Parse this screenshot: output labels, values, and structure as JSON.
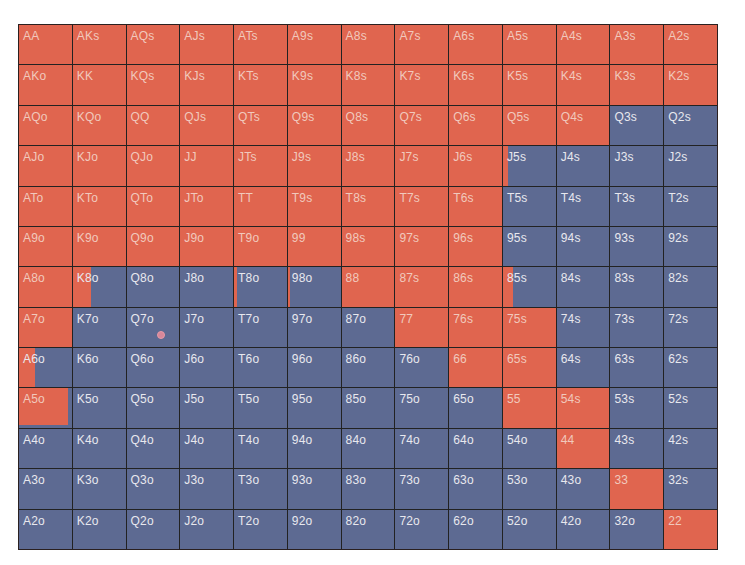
{
  "colors": {
    "raise": "#e0654f",
    "fold": "#5d6a92",
    "grid_line": "#222222",
    "label_on_red": "#f1c9bd",
    "label_on_blue": "#e8e8ee"
  },
  "chart_data": {
    "type": "heatmap",
    "title": "",
    "ranks": [
      "A",
      "K",
      "Q",
      "J",
      "T",
      "9",
      "8",
      "7",
      "6",
      "5",
      "4",
      "3",
      "2"
    ],
    "legend": [
      {
        "name": "raise",
        "color": "#e0654f"
      },
      {
        "name": "fold",
        "color": "#5d6a92"
      }
    ],
    "rows": [
      {
        "hands": [
          "AA",
          "AKs",
          "AQs",
          "AJs",
          "ATs",
          "A9s",
          "A8s",
          "A7s",
          "A6s",
          "A5s",
          "A4s",
          "A3s",
          "A2s"
        ],
        "raise": [
          1,
          1,
          1,
          1,
          1,
          1,
          1,
          1,
          1,
          1,
          1,
          1,
          1
        ]
      },
      {
        "hands": [
          "AKo",
          "KK",
          "KQs",
          "KJs",
          "KTs",
          "K9s",
          "K8s",
          "K7s",
          "K6s",
          "K5s",
          "K4s",
          "K3s",
          "K2s"
        ],
        "raise": [
          1,
          1,
          1,
          1,
          1,
          1,
          1,
          1,
          1,
          1,
          1,
          1,
          1
        ]
      },
      {
        "hands": [
          "AQo",
          "KQo",
          "QQ",
          "QJs",
          "QTs",
          "Q9s",
          "Q8s",
          "Q7s",
          "Q6s",
          "Q5s",
          "Q4s",
          "Q3s",
          "Q2s"
        ],
        "raise": [
          1,
          1,
          1,
          1,
          1,
          1,
          1,
          1,
          1,
          1,
          1,
          0,
          0
        ]
      },
      {
        "hands": [
          "AJo",
          "KJo",
          "QJo",
          "JJ",
          "JTs",
          "J9s",
          "J8s",
          "J7s",
          "J6s",
          "J5s",
          "J4s",
          "J3s",
          "J2s"
        ],
        "raise": [
          1,
          1,
          1,
          1,
          1,
          1,
          1,
          1,
          1,
          0.1,
          0,
          0,
          0
        ]
      },
      {
        "hands": [
          "ATo",
          "KTo",
          "QTo",
          "JTo",
          "TT",
          "T9s",
          "T8s",
          "T7s",
          "T6s",
          "T5s",
          "T4s",
          "T3s",
          "T2s"
        ],
        "raise": [
          1,
          1,
          1,
          1,
          1,
          1,
          1,
          1,
          1,
          0,
          0,
          0,
          0
        ]
      },
      {
        "hands": [
          "A9o",
          "K9o",
          "Q9o",
          "J9o",
          "T9o",
          "99",
          "98s",
          "97s",
          "96s",
          "95s",
          "94s",
          "93s",
          "92s"
        ],
        "raise": [
          1,
          1,
          1,
          1,
          1,
          1,
          1,
          1,
          1,
          0,
          0,
          0,
          0
        ]
      },
      {
        "hands": [
          "A8o",
          "K8o",
          "Q8o",
          "J8o",
          "T8o",
          "98o",
          "88",
          "87s",
          "86s",
          "85s",
          "84s",
          "83s",
          "82s"
        ],
        "raise": [
          1,
          0.35,
          0,
          0,
          0.05,
          0.05,
          1,
          1,
          1,
          0.2,
          0,
          0,
          0
        ]
      },
      {
        "hands": [
          "A7o",
          "K7o",
          "Q7o",
          "J7o",
          "T7o",
          "97o",
          "87o",
          "77",
          "76s",
          "75s",
          "74s",
          "73s",
          "72s"
        ],
        "raise": [
          1,
          0,
          0,
          0,
          0,
          0,
          0,
          1,
          1,
          1,
          0,
          0,
          0
        ]
      },
      {
        "hands": [
          "A6o",
          "K6o",
          "Q6o",
          "J6o",
          "T6o",
          "96o",
          "86o",
          "76o",
          "66",
          "65s",
          "64s",
          "63s",
          "62s"
        ],
        "raise": [
          0.3,
          0,
          0,
          0,
          0,
          0,
          0,
          0,
          1,
          1,
          0,
          0,
          0
        ]
      },
      {
        "hands": [
          "A5o",
          "K5o",
          "Q5o",
          "J5o",
          "T5o",
          "95o",
          "85o",
          "75o",
          "65o",
          "55",
          "54s",
          "53s",
          "52s"
        ],
        "raise": [
          0.92,
          0,
          0,
          0,
          0,
          0,
          0,
          0,
          0,
          1,
          1,
          0,
          0
        ]
      },
      {
        "hands": [
          "A4o",
          "K4o",
          "Q4o",
          "J4o",
          "T4o",
          "94o",
          "84o",
          "74o",
          "64o",
          "54o",
          "44",
          "43s",
          "42s"
        ],
        "raise": [
          0,
          0,
          0,
          0,
          0,
          0,
          0,
          0,
          0,
          0,
          1,
          0,
          0
        ]
      },
      {
        "hands": [
          "A3o",
          "K3o",
          "Q3o",
          "J3o",
          "T3o",
          "93o",
          "83o",
          "73o",
          "63o",
          "53o",
          "43o",
          "33",
          "32s"
        ],
        "raise": [
          0,
          0,
          0,
          0,
          0,
          0,
          0,
          0,
          0,
          0,
          0,
          1,
          0
        ]
      },
      {
        "hands": [
          "A2o",
          "K2o",
          "Q2o",
          "J2o",
          "T2o",
          "92o",
          "82o",
          "72o",
          "62o",
          "52o",
          "42o",
          "32o",
          "22"
        ],
        "raise": [
          0,
          0,
          0,
          0,
          0,
          0,
          0,
          0,
          0,
          0,
          0,
          0,
          1
        ]
      }
    ]
  }
}
